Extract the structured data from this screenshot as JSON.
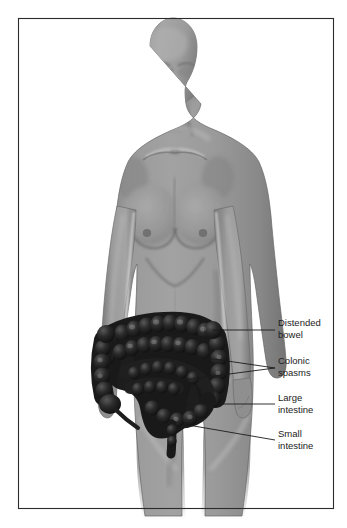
{
  "figure": {
    "kind": "anatomical-illustration",
    "view": "anterior",
    "body_figure": "female-torso-silhouette",
    "border": {
      "present": true,
      "color": "#2b2b2b"
    },
    "colors": {
      "background": "#ffffff",
      "body_fill": "#909090",
      "body_shadow": "#6f6f6f",
      "body_highlight": "#b9b9b9",
      "body_outline": "#5a5a5a",
      "bowel_fill": "#1a1a1a",
      "bowel_highlight": "#4a4a4a",
      "leader_line": "#1c1c1c",
      "label_text": "#1c1c1c"
    },
    "labels": [
      {
        "id": "distended-bowel",
        "line1": "Distended",
        "line2": "bowel",
        "text_x": 278,
        "text_y": 326,
        "leader": [
          [
            212,
            330
          ],
          [
            275,
            330
          ]
        ]
      },
      {
        "id": "colonic-spasms",
        "line1": "Colonic",
        "line2": "spasms",
        "text_x": 278,
        "text_y": 364,
        "leader": [
          [
            176,
            381
          ],
          [
            275,
            368
          ]
        ]
      },
      {
        "id": "colonic-spasms-second",
        "line1": "",
        "line2": "",
        "text_x": 0,
        "text_y": 0,
        "leader": [
          [
            200,
            357
          ],
          [
            275,
            368
          ]
        ]
      },
      {
        "id": "large-intestine",
        "line1": "Large",
        "line2": "intestine",
        "text_x": 278,
        "text_y": 401,
        "leader": [
          [
            172,
            404
          ],
          [
            275,
            404
          ]
        ]
      },
      {
        "id": "small-intestine",
        "line1": "Small",
        "line2": "intestine",
        "text_x": 278,
        "text_y": 437,
        "leader": [
          [
            188,
            425
          ],
          [
            275,
            440
          ]
        ]
      }
    ],
    "anatomy_parts": [
      "head",
      "neck",
      "shoulders",
      "left-arm",
      "right-arm",
      "chest",
      "breasts",
      "abdomen",
      "hips",
      "thighs",
      "ascending-colon",
      "transverse-colon",
      "descending-colon",
      "sigmoid-colon",
      "small-intestine"
    ]
  }
}
